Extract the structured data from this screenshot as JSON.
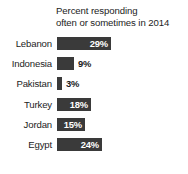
{
  "chart_data": {
    "type": "bar",
    "orientation": "horizontal",
    "title": "Percent responding\noften or sometimes in 2014",
    "title_line1": "Percent responding",
    "title_line2": "often or sometimes in 2014",
    "xlabel": "",
    "ylabel": "",
    "xlim": [
      0,
      30
    ],
    "grid": false,
    "legend": null,
    "bar_color": "#3a3a3a",
    "background_color": "#ffffff",
    "categories": [
      "Lebanon",
      "Indonesia",
      "Pakistan",
      "Turkey",
      "Jordan",
      "Egypt"
    ],
    "values": [
      29,
      9,
      3,
      18,
      15,
      24
    ],
    "value_labels": [
      "29%",
      "9%",
      "3%",
      "18%",
      "15%",
      "24%"
    ],
    "points": [
      {
        "category": "Lebanon",
        "value": 29,
        "label": "29%",
        "label_position": "inside",
        "bar_px": 54
      },
      {
        "category": "Indonesia",
        "value": 9,
        "label": "9%",
        "label_position": "outside",
        "bar_px": 17
      },
      {
        "category": "Pakistan",
        "value": 3,
        "label": "3%",
        "label_position": "outside",
        "bar_px": 5
      },
      {
        "category": "Turkey",
        "value": 18,
        "label": "18%",
        "label_position": "inside",
        "bar_px": 34
      },
      {
        "category": "Jordan",
        "value": 15,
        "label": "15%",
        "label_position": "inside",
        "bar_px": 28
      },
      {
        "category": "Egypt",
        "value": 24,
        "label": "24%",
        "label_position": "inside",
        "bar_px": 45
      }
    ]
  }
}
